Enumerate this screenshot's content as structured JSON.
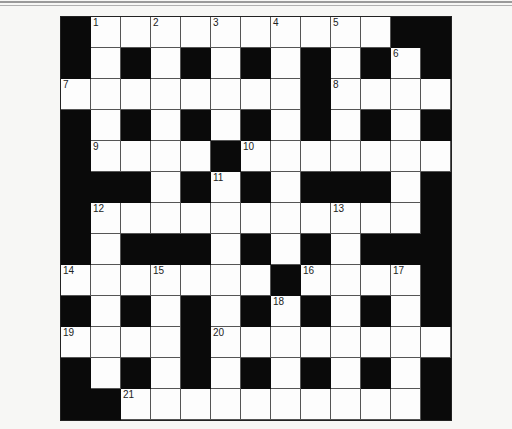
{
  "puzzle": {
    "rows": 13,
    "cols": 13,
    "layout": [
      "#1.2.3.4.5.##",
      "#.#.#.#.#.#6#",
      "7.......#8...",
      "#.#.#.#.#.#.#",
      "#9...#10......",
      "###.#11#.###.#",
      "#12.......13..#",
      "#.###.#.#.###",
      "14..15...#16..17#",
      "#.#.#.#18#.#.#",
      "19...#20.......",
      "#.#.#.#.#.#.#",
      "##21.........#"
    ],
    "grid": [
      [
        "B",
        "W",
        "W",
        "W",
        "W",
        "W",
        "W",
        "W",
        "W",
        "W",
        "W",
        "B",
        "B"
      ],
      [
        "B",
        "W",
        "B",
        "W",
        "B",
        "W",
        "B",
        "W",
        "B",
        "W",
        "B",
        "W",
        "B"
      ],
      [
        "W",
        "W",
        "W",
        "W",
        "W",
        "W",
        "W",
        "W",
        "B",
        "W",
        "W",
        "W",
        "W"
      ],
      [
        "B",
        "W",
        "B",
        "W",
        "B",
        "W",
        "B",
        "W",
        "B",
        "W",
        "B",
        "W",
        "B"
      ],
      [
        "B",
        "W",
        "W",
        "W",
        "W",
        "B",
        "W",
        "W",
        "W",
        "W",
        "W",
        "W",
        "W"
      ],
      [
        "B",
        "B",
        "B",
        "W",
        "B",
        "W",
        "B",
        "W",
        "B",
        "B",
        "B",
        "W",
        "B"
      ],
      [
        "B",
        "W",
        "W",
        "W",
        "W",
        "W",
        "W",
        "W",
        "W",
        "W",
        "W",
        "W",
        "B"
      ],
      [
        "B",
        "W",
        "B",
        "B",
        "B",
        "W",
        "B",
        "W",
        "B",
        "W",
        "B",
        "B",
        "B"
      ],
      [
        "W",
        "W",
        "W",
        "W",
        "W",
        "W",
        "W",
        "B",
        "W",
        "W",
        "W",
        "W",
        "B"
      ],
      [
        "B",
        "W",
        "B",
        "W",
        "B",
        "W",
        "B",
        "W",
        "B",
        "W",
        "B",
        "W",
        "B"
      ],
      [
        "W",
        "W",
        "W",
        "W",
        "B",
        "W",
        "W",
        "W",
        "W",
        "W",
        "W",
        "W",
        "W"
      ],
      [
        "B",
        "W",
        "B",
        "W",
        "B",
        "W",
        "B",
        "W",
        "B",
        "W",
        "B",
        "W",
        "B"
      ],
      [
        "B",
        "B",
        "W",
        "W",
        "W",
        "W",
        "W",
        "W",
        "W",
        "W",
        "W",
        "W",
        "B"
      ]
    ],
    "numbers": [
      {
        "r": 0,
        "c": 1,
        "n": "1"
      },
      {
        "r": 0,
        "c": 3,
        "n": "2"
      },
      {
        "r": 0,
        "c": 5,
        "n": "3"
      },
      {
        "r": 0,
        "c": 7,
        "n": "4"
      },
      {
        "r": 0,
        "c": 9,
        "n": "5"
      },
      {
        "r": 1,
        "c": 11,
        "n": "6"
      },
      {
        "r": 2,
        "c": 0,
        "n": "7"
      },
      {
        "r": 2,
        "c": 9,
        "n": "8"
      },
      {
        "r": 4,
        "c": 1,
        "n": "9"
      },
      {
        "r": 4,
        "c": 6,
        "n": "10"
      },
      {
        "r": 5,
        "c": 5,
        "n": "11"
      },
      {
        "r": 6,
        "c": 1,
        "n": "12"
      },
      {
        "r": 6,
        "c": 9,
        "n": "13"
      },
      {
        "r": 8,
        "c": 0,
        "n": "14"
      },
      {
        "r": 8,
        "c": 3,
        "n": "15"
      },
      {
        "r": 8,
        "c": 8,
        "n": "16"
      },
      {
        "r": 8,
        "c": 11,
        "n": "17"
      },
      {
        "r": 9,
        "c": 7,
        "n": "18"
      },
      {
        "r": 10,
        "c": 0,
        "n": "19"
      },
      {
        "r": 10,
        "c": 5,
        "n": "20"
      },
      {
        "r": 12,
        "c": 2,
        "n": "21"
      }
    ]
  },
  "colors": {
    "block": "#0a0a0a",
    "square": "#fdfdfd",
    "gridline": "#555555"
  }
}
